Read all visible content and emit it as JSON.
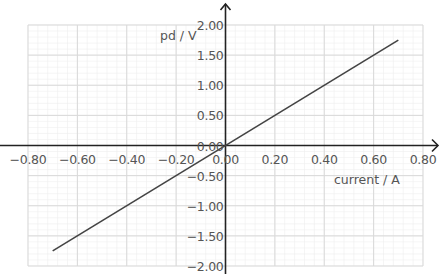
{
  "chart_data": {
    "type": "line",
    "title": "",
    "xlabel": "current / A",
    "ylabel": "pd / V",
    "xlim": [
      -0.8,
      0.8
    ],
    "ylim": [
      -2.0,
      2.0
    ],
    "x_ticks": [
      "-0.80",
      "-0.60",
      "-0.40",
      "-0.20",
      "0.00",
      "0.20",
      "0.40",
      "0.60",
      "0.80"
    ],
    "y_ticks": [
      "2.00",
      "1.50",
      "1.00",
      "0.50",
      "0.00",
      "-0.50",
      "-1.00",
      "-1.50",
      "-2.00"
    ],
    "grid": true,
    "legend": null,
    "series": [
      {
        "name": "pd vs current",
        "x": [
          -0.7,
          0.7
        ],
        "y": [
          -1.75,
          1.75
        ],
        "color": "#444444"
      }
    ]
  },
  "colors": {
    "major_grid": "#d9d9d9",
    "minor_grid": "#efefef",
    "axis": "#222222",
    "line": "#444444",
    "text": "#555555"
  }
}
